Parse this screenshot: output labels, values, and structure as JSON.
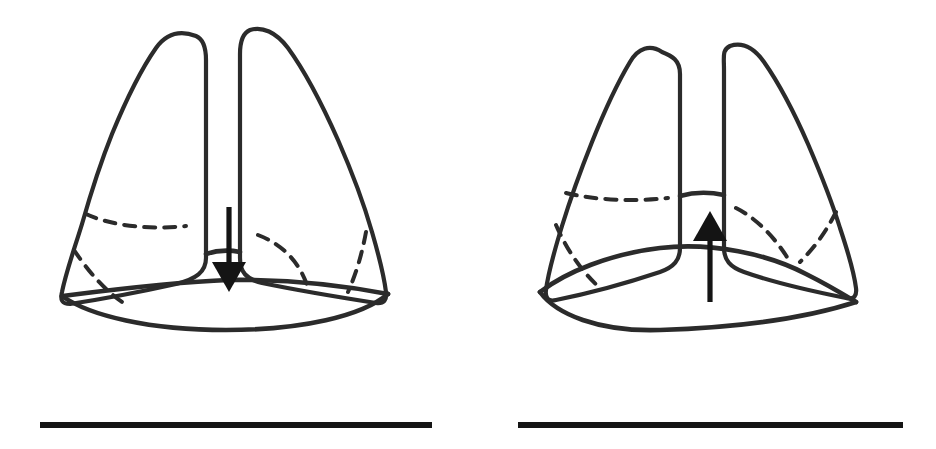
{
  "figure": {
    "width": 936,
    "height": 449,
    "background_color": "#ffffff",
    "ink_color": "#2b2b2b",
    "arrow_color": "#141414",
    "style": "hand-drawn line illustration, black ink on white"
  },
  "panels": [
    {
      "id": "left-panel",
      "name": "inhalation",
      "description": "Thorax with expanded lungs and a flattened, descended diaphragm",
      "arrow": {
        "name": "down-arrow",
        "direction": "down",
        "meaning": "diaphragm contracts and moves downward",
        "shaft_x": 229,
        "shaft_top_y": 207,
        "shaft_bottom_y": 265,
        "tip_y": 292,
        "head_half_width": 17,
        "head_height": 30
      },
      "lungs": [
        {
          "name": "left-lung-outline",
          "side": "left",
          "apex_y": 34,
          "base_y": 300
        },
        {
          "name": "right-lung-outline",
          "side": "right",
          "apex_y": 28,
          "base_y": 300
        }
      ],
      "fissures": [
        {
          "name": "horizontal-fissure-left-lung",
          "type": "horizontal"
        },
        {
          "name": "oblique-fissure-left-lung",
          "type": "oblique"
        },
        {
          "name": "oblique-fissure-right-lung-medial",
          "type": "curved"
        },
        {
          "name": "oblique-fissure-right-lung-lateral",
          "type": "oblique"
        }
      ],
      "diaphragm": {
        "name": "diaphragm-band",
        "state": "flattened / descended",
        "upper_line_apex_y": 280,
        "lower_line_apex_y": 296
      },
      "baseline": {
        "name": "baseline-rule",
        "x1": 40,
        "x2": 432,
        "y": 425
      }
    },
    {
      "id": "right-panel",
      "name": "exhalation",
      "description": "Thorax with recoiled lungs and a raised, domed diaphragm",
      "arrow": {
        "name": "up-arrow",
        "direction": "up",
        "meaning": "diaphragm relaxes and moves upward",
        "shaft_x": 710,
        "shaft_bottom_y": 302,
        "shaft_top_y": 240,
        "tip_y": 211,
        "head_half_width": 17,
        "head_height": 30
      },
      "lungs": [
        {
          "name": "left-lung-outline",
          "side": "left",
          "apex_y": 48,
          "base_y": 290
        },
        {
          "name": "right-lung-outline",
          "side": "right",
          "apex_y": 42,
          "base_y": 290
        }
      ],
      "fissures": [
        {
          "name": "horizontal-fissure-left-lung",
          "type": "horizontal"
        },
        {
          "name": "oblique-fissure-left-lung",
          "type": "oblique"
        },
        {
          "name": "oblique-fissure-right-lung-medial",
          "type": "oblique"
        },
        {
          "name": "oblique-fissure-right-lung-lateral",
          "type": "oblique"
        }
      ],
      "diaphragm": {
        "name": "diaphragm-band",
        "state": "domed / elevated",
        "upper_line_apex_y": 252,
        "lower_line_apex_y": 268
      },
      "baseline": {
        "name": "baseline-rule",
        "x1": 518,
        "x2": 903,
        "y": 425
      }
    }
  ]
}
